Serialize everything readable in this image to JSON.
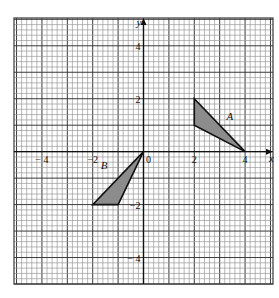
{
  "chart_data": {
    "type": "scatter",
    "title": "",
    "xlabel": "x",
    "ylabel": "y",
    "xlim": [
      -5.1,
      5.1
    ],
    "ylim": [
      -5.0,
      5.05
    ],
    "grid": true,
    "grid_minor_step": 0.2,
    "grid_major_step": 1,
    "x_tick_labels": [
      {
        "value": -4,
        "text": "− 4"
      },
      {
        "value": -2,
        "text": "−2"
      },
      {
        "value": 0,
        "text": "0"
      },
      {
        "value": 2,
        "text": "2"
      },
      {
        "value": 4,
        "text": "4"
      }
    ],
    "y_tick_labels": [
      {
        "value": 4,
        "text": "4"
      },
      {
        "value": 2,
        "text": "2"
      },
      {
        "value": -2,
        "text": "−2"
      },
      {
        "value": -4,
        "text": "− 4"
      }
    ],
    "shapes": [
      {
        "name": "A",
        "type": "triangle",
        "vertices": [
          [
            2,
            2
          ],
          [
            2,
            1
          ],
          [
            4,
            0
          ]
        ],
        "fill": "#8c8c8c",
        "label_pos": [
          3.4,
          1.2
        ]
      },
      {
        "name": "B",
        "type": "triangle",
        "vertices": [
          [
            0,
            0
          ],
          [
            -2,
            -2
          ],
          [
            -1,
            -2
          ]
        ],
        "fill": "#8c8c8c",
        "label_pos": [
          -1.55,
          -0.65
        ]
      }
    ]
  },
  "axes": {
    "x_label": "x",
    "y_label": "y"
  },
  "colors": {
    "grid_minor": "#9a9a9a",
    "grid_major": "#3a3a3a",
    "axis": "#111111",
    "shape_fill": "#8c8c8c",
    "shape_stroke": "#111111"
  }
}
